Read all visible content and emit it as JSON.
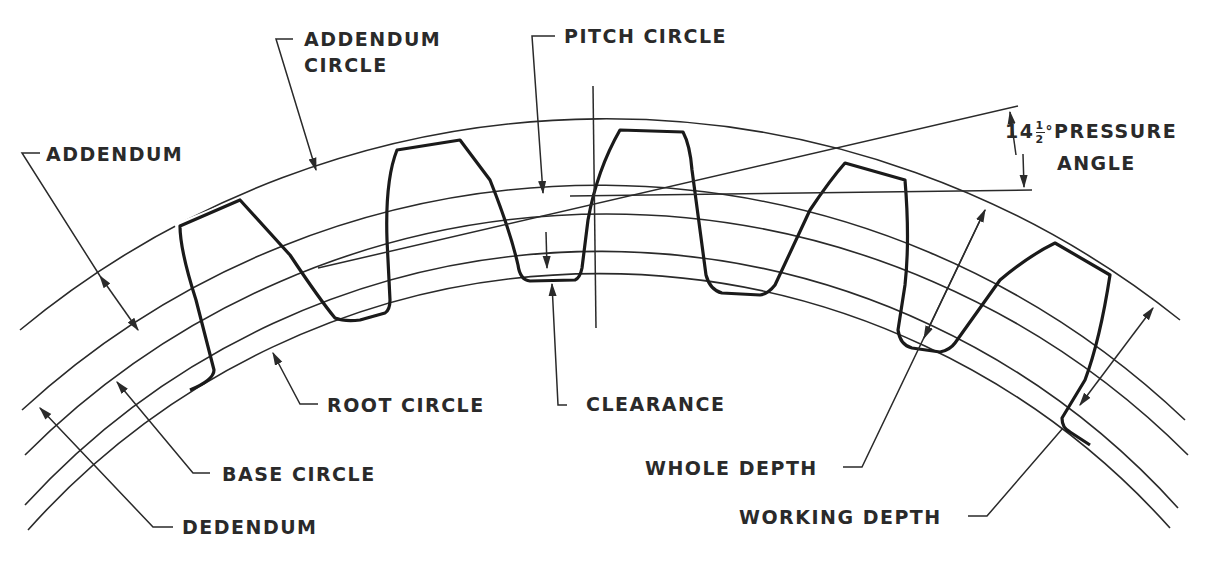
{
  "diagram": {
    "colors": {
      "ink": "#2a2a2a",
      "background": "#ffffff"
    },
    "labels": {
      "addendum_circle_line1": "ADDENDUM",
      "addendum_circle_line2": "CIRCLE",
      "pitch_circle": "PITCH CIRCLE",
      "addendum": "ADDENDUM",
      "pressure_angle_whole": "14",
      "pressure_angle_frac_num": "1",
      "pressure_angle_frac_den": "2",
      "pressure_angle_degree": "°",
      "pressure_angle_line1": "PRESSURE",
      "pressure_angle_line2": "ANGLE",
      "root_circle": "ROOT CIRCLE",
      "clearance": "CLEARANCE",
      "base_circle": "BASE CIRCLE",
      "dedendum": "DEDENDUM",
      "whole_depth": "WHOLE DEPTH",
      "working_depth": "WORKING DEPTH"
    },
    "circles": [
      {
        "name": "addendum-circle",
        "radius": 919
      },
      {
        "name": "pitch-circle",
        "radius": 851
      },
      {
        "name": "base-circle",
        "radius": 822
      },
      {
        "name": "working-depth-circle",
        "radius": 779
      },
      {
        "name": "root-circle",
        "radius": 766
      }
    ],
    "center": {
      "x": 595,
      "y": 1047
    },
    "pressure_angle_degrees": 14.5
  }
}
